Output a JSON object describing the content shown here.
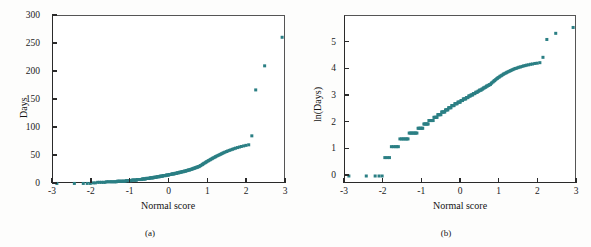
{
  "figure": {
    "background_color": "#fdfdfc",
    "marker_color": "#2b7f84",
    "axis_color": "#2a2a2a",
    "panel_a_caption": "(a)",
    "panel_b_caption": "(b)"
  },
  "chart_data": [
    {
      "type": "scatter",
      "title": "",
      "panel": "(a)",
      "xlabel": "Normal score",
      "ylabel": "Days",
      "xlim": [
        -3,
        3
      ],
      "ylim": [
        0,
        300
      ],
      "xticks": [
        -3,
        -2,
        -1,
        0,
        1,
        2,
        3
      ],
      "xtick_labels": [
        "-3",
        "-2",
        "-1",
        "0",
        "1",
        "2",
        "3"
      ],
      "yticks": [
        0,
        50,
        100,
        150,
        200,
        250,
        300
      ],
      "ytick_labels": [
        "0",
        "50",
        "100",
        "150",
        "200",
        "250",
        "300"
      ],
      "grid": false,
      "legend": "none",
      "marker": "square",
      "marker_color": "#2b7f84",
      "x": [
        -2.9,
        -2.45,
        -2.22,
        -2.12,
        -2.04,
        -1.97,
        -1.91,
        -1.85,
        -1.8,
        -1.75,
        -1.7,
        -1.66,
        -1.62,
        -1.58,
        -1.54,
        -1.5,
        -1.47,
        -1.43,
        -1.4,
        -1.37,
        -1.34,
        -1.31,
        -1.28,
        -1.25,
        -1.22,
        -1.19,
        -1.17,
        -1.14,
        -1.11,
        -1.09,
        -1.06,
        -1.04,
        -1.01,
        -0.99,
        -0.96,
        -0.94,
        -0.92,
        -0.89,
        -0.87,
        -0.85,
        -0.83,
        -0.8,
        -0.78,
        -0.76,
        -0.74,
        -0.72,
        -0.7,
        -0.68,
        -0.66,
        -0.64,
        -0.62,
        -0.6,
        -0.58,
        -0.56,
        -0.54,
        -0.52,
        -0.5,
        -0.48,
        -0.46,
        -0.44,
        -0.42,
        -0.4,
        -0.38,
        -0.36,
        -0.34,
        -0.32,
        -0.3,
        -0.28,
        -0.26,
        -0.24,
        -0.22,
        -0.2,
        -0.18,
        -0.16,
        -0.14,
        -0.12,
        -0.1,
        -0.08,
        -0.06,
        -0.04,
        -0.02,
        0.0,
        0.02,
        0.04,
        0.06,
        0.08,
        0.1,
        0.12,
        0.14,
        0.16,
        0.18,
        0.2,
        0.22,
        0.24,
        0.26,
        0.28,
        0.3,
        0.32,
        0.34,
        0.36,
        0.38,
        0.4,
        0.42,
        0.44,
        0.46,
        0.48,
        0.5,
        0.52,
        0.54,
        0.56,
        0.58,
        0.6,
        0.62,
        0.64,
        0.66,
        0.68,
        0.7,
        0.72,
        0.74,
        0.76,
        0.78,
        0.8,
        0.83,
        0.85,
        0.87,
        0.89,
        0.92,
        0.94,
        0.96,
        0.99,
        1.01,
        1.04,
        1.06,
        1.09,
        1.11,
        1.14,
        1.17,
        1.19,
        1.22,
        1.25,
        1.28,
        1.31,
        1.34,
        1.37,
        1.4,
        1.43,
        1.47,
        1.5,
        1.54,
        1.58,
        1.62,
        1.66,
        1.7,
        1.75,
        1.8,
        1.85,
        1.91,
        1.97,
        2.04,
        2.12,
        2.22,
        2.45,
        2.9
      ],
      "y": [
        1,
        1,
        1,
        1,
        1,
        2,
        2,
        3,
        3,
        3,
        3,
        3,
        4,
        4,
        4,
        4,
        4,
        4,
        4,
        4,
        5,
        5,
        5,
        5,
        5,
        5,
        5,
        5,
        6,
        6,
        6,
        6,
        6,
        6,
        7,
        7,
        7,
        7,
        7,
        7,
        8,
        8,
        8,
        8,
        8,
        8,
        9,
        9,
        9,
        9,
        9,
        10,
        10,
        10,
        10,
        10,
        11,
        11,
        11,
        11,
        11,
        12,
        12,
        12,
        12,
        13,
        13,
        13,
        13,
        14,
        14,
        14,
        14,
        15,
        15,
        15,
        15,
        16,
        16,
        16,
        16,
        17,
        17,
        17,
        18,
        18,
        18,
        18,
        19,
        19,
        19,
        20,
        20,
        20,
        21,
        21,
        21,
        22,
        22,
        22,
        23,
        23,
        23,
        24,
        24,
        25,
        25,
        25,
        26,
        26,
        27,
        27,
        28,
        28,
        29,
        29,
        30,
        30,
        31,
        31,
        32,
        33,
        34,
        35,
        36,
        37,
        38,
        39,
        40,
        41,
        42,
        43,
        44,
        45,
        46,
        47,
        48,
        49,
        50,
        51,
        52,
        53,
        54,
        55,
        56,
        57,
        58,
        59,
        60,
        61,
        62,
        63,
        64,
        65,
        66,
        67,
        68,
        69,
        70,
        86,
        168,
        211,
        262
      ]
    },
    {
      "type": "scatter",
      "title": "",
      "panel": "(b)",
      "xlabel": "Normal score",
      "ylabel": "ln(Days)",
      "xlim": [
        -3,
        3
      ],
      "ylim": [
        -0.3,
        6.0
      ],
      "xticks": [
        -3,
        -2,
        -1,
        0,
        1,
        2,
        3
      ],
      "xtick_labels": [
        "-3",
        "-2",
        "-1",
        "0",
        "1",
        "2",
        "3"
      ],
      "yticks": [
        0,
        1,
        2,
        3,
        4,
        5
      ],
      "ytick_labels": [
        "0",
        "1",
        "2",
        "3",
        "4",
        "5"
      ],
      "grid": false,
      "legend": "none",
      "marker": "square",
      "marker_color": "#2b7f84",
      "x": [
        -2.9,
        -2.45,
        -2.22,
        -2.12,
        -2.04,
        -1.97,
        -1.91,
        -1.85,
        -1.8,
        -1.75,
        -1.7,
        -1.66,
        -1.62,
        -1.58,
        -1.54,
        -1.5,
        -1.47,
        -1.43,
        -1.4,
        -1.37,
        -1.34,
        -1.31,
        -1.28,
        -1.25,
        -1.22,
        -1.19,
        -1.17,
        -1.14,
        -1.11,
        -1.09,
        -1.06,
        -1.04,
        -1.01,
        -0.99,
        -0.96,
        -0.94,
        -0.92,
        -0.89,
        -0.87,
        -0.85,
        -0.83,
        -0.8,
        -0.78,
        -0.76,
        -0.74,
        -0.72,
        -0.7,
        -0.68,
        -0.66,
        -0.64,
        -0.62,
        -0.6,
        -0.58,
        -0.56,
        -0.54,
        -0.52,
        -0.5,
        -0.48,
        -0.46,
        -0.44,
        -0.42,
        -0.4,
        -0.38,
        -0.36,
        -0.34,
        -0.32,
        -0.3,
        -0.28,
        -0.26,
        -0.24,
        -0.22,
        -0.2,
        -0.18,
        -0.16,
        -0.14,
        -0.12,
        -0.1,
        -0.08,
        -0.06,
        -0.04,
        -0.02,
        0.0,
        0.02,
        0.04,
        0.06,
        0.08,
        0.1,
        0.12,
        0.14,
        0.16,
        0.18,
        0.2,
        0.22,
        0.24,
        0.26,
        0.28,
        0.3,
        0.32,
        0.34,
        0.36,
        0.38,
        0.4,
        0.42,
        0.44,
        0.46,
        0.48,
        0.5,
        0.52,
        0.54,
        0.56,
        0.58,
        0.6,
        0.62,
        0.64,
        0.66,
        0.68,
        0.7,
        0.72,
        0.74,
        0.76,
        0.78,
        0.8,
        0.83,
        0.85,
        0.87,
        0.89,
        0.92,
        0.94,
        0.96,
        0.99,
        1.01,
        1.04,
        1.06,
        1.09,
        1.11,
        1.14,
        1.17,
        1.19,
        1.22,
        1.25,
        1.28,
        1.31,
        1.34,
        1.37,
        1.4,
        1.43,
        1.47,
        1.5,
        1.54,
        1.58,
        1.62,
        1.66,
        1.7,
        1.75,
        1.8,
        1.85,
        1.91,
        1.97,
        2.04,
        2.12,
        2.22,
        2.45,
        2.9
      ],
      "y": [
        0.0,
        0.0,
        0.0,
        0.0,
        0.0,
        0.69,
        0.69,
        0.69,
        1.1,
        1.1,
        1.1,
        1.1,
        1.1,
        1.39,
        1.39,
        1.39,
        1.39,
        1.39,
        1.39,
        1.39,
        1.61,
        1.61,
        1.61,
        1.61,
        1.61,
        1.61,
        1.61,
        1.61,
        1.79,
        1.79,
        1.79,
        1.79,
        1.79,
        1.79,
        1.95,
        1.95,
        1.95,
        1.95,
        1.95,
        1.95,
        2.08,
        2.08,
        2.08,
        2.08,
        2.08,
        2.08,
        2.2,
        2.2,
        2.2,
        2.2,
        2.2,
        2.3,
        2.3,
        2.3,
        2.3,
        2.3,
        2.4,
        2.4,
        2.4,
        2.4,
        2.4,
        2.48,
        2.48,
        2.48,
        2.48,
        2.56,
        2.56,
        2.56,
        2.56,
        2.64,
        2.64,
        2.64,
        2.64,
        2.71,
        2.71,
        2.71,
        2.71,
        2.77,
        2.77,
        2.77,
        2.77,
        2.83,
        2.83,
        2.83,
        2.89,
        2.89,
        2.89,
        2.89,
        2.94,
        2.94,
        2.94,
        3.0,
        3.0,
        3.0,
        3.04,
        3.04,
        3.04,
        3.09,
        3.09,
        3.09,
        3.14,
        3.14,
        3.14,
        3.18,
        3.18,
        3.22,
        3.22,
        3.22,
        3.26,
        3.26,
        3.3,
        3.3,
        3.33,
        3.33,
        3.37,
        3.37,
        3.4,
        3.4,
        3.43,
        3.43,
        3.47,
        3.5,
        3.53,
        3.56,
        3.58,
        3.61,
        3.64,
        3.66,
        3.69,
        3.71,
        3.74,
        3.76,
        3.78,
        3.81,
        3.83,
        3.85,
        3.87,
        3.89,
        3.91,
        3.93,
        3.95,
        3.97,
        3.99,
        4.01,
        4.03,
        4.04,
        4.06,
        4.08,
        4.09,
        4.11,
        4.13,
        4.14,
        4.16,
        4.17,
        4.19,
        4.2,
        4.22,
        4.23,
        4.25,
        4.45,
        5.12,
        5.35,
        5.57
      ]
    }
  ]
}
